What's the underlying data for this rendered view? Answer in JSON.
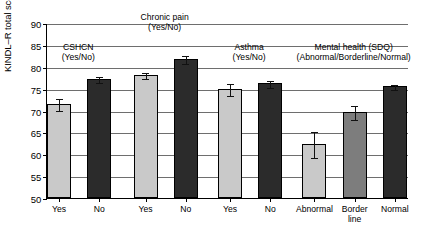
{
  "chart_data": {
    "type": "bar",
    "title": "",
    "xlabel": "",
    "ylabel": "KINDL–R total score",
    "ylim": [
      50,
      90
    ],
    "yticks": [
      50,
      55,
      60,
      65,
      70,
      75,
      80,
      85,
      90
    ],
    "grid": true,
    "legend": "none",
    "categories": [
      "Yes",
      "No",
      "Yes",
      "No",
      "Yes",
      "No",
      "Abnormal",
      "Border line",
      "Normal"
    ],
    "values": [
      71.5,
      77.2,
      78.2,
      81.8,
      75.0,
      76.2,
      62.3,
      69.7,
      75.5
    ],
    "errors_low": [
      1.4,
      0.6,
      0.7,
      0.9,
      1.4,
      0.8,
      3.0,
      1.6,
      0.6
    ],
    "errors_high": [
      1.4,
      0.6,
      0.7,
      0.9,
      1.4,
      0.8,
      3.0,
      1.6,
      0.6
    ],
    "bar_colors": [
      "#c9c9c9",
      "#2b2b2b",
      "#c9c9c9",
      "#2b2b2b",
      "#c9c9c9",
      "#2b2b2b",
      "#c9c9c9",
      "#7d7d7d",
      "#2b2b2b"
    ],
    "groups": [
      {
        "label_line1": "CSHCN",
        "label_line2": "(Yes/No)",
        "members": [
          0,
          1
        ]
      },
      {
        "label_line1": "Chronic pain",
        "label_line2": "(Yes/No)",
        "members": [
          2,
          3
        ]
      },
      {
        "label_line1": "Asthma",
        "label_line2": "(Yes/No)",
        "members": [
          4,
          5
        ]
      },
      {
        "label_line1": "Mental health (SDQ)",
        "label_line2": "(Abnormal/Borderline/Normal)",
        "members": [
          6,
          7,
          8
        ]
      }
    ]
  },
  "axis": {
    "y_label": "KINDL–R total score",
    "y_ticks": [
      "90",
      "85",
      "80",
      "75",
      "70",
      "65",
      "60",
      "55",
      "50"
    ]
  },
  "x_labels": [
    {
      "line1": "Yes",
      "line2": ""
    },
    {
      "line1": "No",
      "line2": ""
    },
    {
      "line1": "Yes",
      "line2": ""
    },
    {
      "line1": "No",
      "line2": ""
    },
    {
      "line1": "Yes",
      "line2": ""
    },
    {
      "line1": "No",
      "line2": ""
    },
    {
      "line1": "Abnormal",
      "line2": ""
    },
    {
      "line1": "Border",
      "line2": "line"
    },
    {
      "line1": "Normal",
      "line2": ""
    }
  ],
  "group_headers": [
    {
      "line1": "CSHCN",
      "line2": "(Yes/No)"
    },
    {
      "line1": "Chronic pain",
      "line2": "(Yes/No)"
    },
    {
      "line1": "Asthma",
      "line2": "(Yes/No)"
    },
    {
      "line1": "Mental health (SDQ)",
      "line2": "(Abnormal/Borderline/Normal)"
    }
  ],
  "colors": {
    "light_gray": "#c9c9c9",
    "mid_gray": "#7d7d7d",
    "dark": "#2b2b2b",
    "gridline": "#6e6e6e",
    "axis": "#000000"
  }
}
